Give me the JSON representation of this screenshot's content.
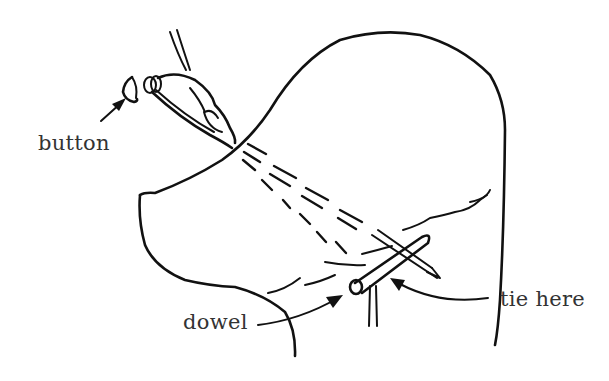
{
  "figure": {
    "type": "line-art illustration",
    "labels": {
      "button": "button",
      "dowel": "dowel",
      "tie_here": "tie here"
    },
    "colors": {
      "ink": "#111111",
      "label_text": "#333333",
      "background": "#ffffff"
    }
  }
}
